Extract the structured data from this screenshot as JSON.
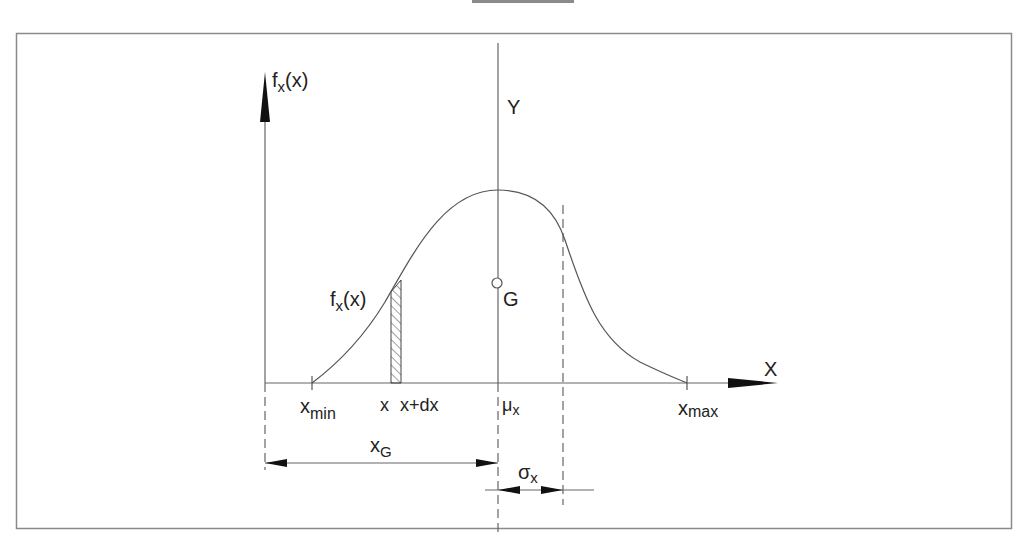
{
  "figure": {
    "type": "probability-density-diagram",
    "labels": {
      "y_axis": {
        "main": "f",
        "sub": "x",
        "tail": "(x)"
      },
      "curve": {
        "main": "f",
        "sub": "x",
        "tail": "(x)"
      },
      "vertical_axis": "Y",
      "horizontal_axis": "X",
      "centroid": "G",
      "x_min": {
        "main": "x",
        "sub": "min"
      },
      "x_max": {
        "main": "x",
        "sub": "max"
      },
      "x": "x",
      "x_dx": "x+dx",
      "mu": {
        "main": "μ",
        "sub": "x"
      },
      "x_g": {
        "main": "x",
        "sub": "G"
      },
      "sigma": {
        "main": "σ",
        "sub": "x"
      }
    },
    "colors": {
      "line": "#555555",
      "frame": "#8a8a8a",
      "text": "#222222"
    }
  }
}
